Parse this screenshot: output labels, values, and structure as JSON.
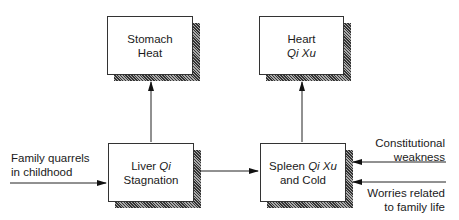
{
  "nodes": {
    "stomach_heat": {
      "line1": "Stomach",
      "line2": "Heat"
    },
    "heart_qi_xu": {
      "line1": "Heart",
      "line2_italic": "Qi Xu"
    },
    "liver_qi": {
      "line1_plain": "Liver ",
      "line1_italic": "Qi",
      "line2": "Stagnation"
    },
    "spleen_qi_xu": {
      "line1_plain": "Spleen ",
      "line1_italic": "Qi Xu",
      "line2": "and Cold"
    }
  },
  "inputs": {
    "family_quarrels": {
      "line1": "Family quarrels",
      "line2": "in childhood"
    },
    "constitutional": {
      "line1": "Constitutional",
      "line2": "weakness"
    },
    "worries": {
      "line1": "Worries related",
      "line2": "to family life"
    }
  },
  "edges": [
    {
      "from": "family_quarrels",
      "to": "liver_qi"
    },
    {
      "from": "liver_qi",
      "to": "stomach_heat"
    },
    {
      "from": "liver_qi",
      "to": "spleen_qi_xu"
    },
    {
      "from": "spleen_qi_xu",
      "to": "heart_qi_xu"
    },
    {
      "from": "constitutional",
      "to": "spleen_qi_xu"
    },
    {
      "from": "worries",
      "to": "spleen_qi_xu"
    }
  ]
}
